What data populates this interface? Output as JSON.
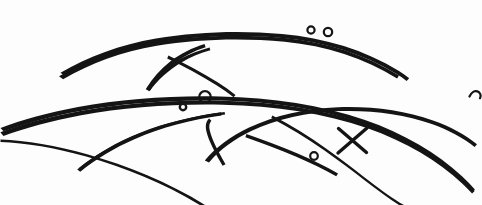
{
  "artwork": {
    "title": "Overlapping curved ink strokes",
    "medium": "black ink line drawing on white paper",
    "background_color": "#fdfdfd",
    "ink_color": "#141414",
    "width": 482,
    "height": 205,
    "alt_text": "A freehand ink drawing of several long overlapping arcs resembling blades of grass or feather strokes, with three small open circles, one larger open circle, and a crossed X mark."
  },
  "elements": {
    "arcs": [
      {
        "id": "upper-long-arc",
        "label": "upper long arc sweeping from left to upper right"
      },
      {
        "id": "upper-inner-arc",
        "label": "upper inner arc parallel beneath the long arc"
      },
      {
        "id": "upper-leaf-stroke",
        "label": "leaf-shaped stroke tapering to a point at lower left"
      },
      {
        "id": "upper-right-tail",
        "label": "thin tail descending to the right"
      },
      {
        "id": "mid-long-arc",
        "label": "middle long arc crossing the page"
      },
      {
        "id": "mid-inner-arc",
        "label": "middle inner arc parallel beneath"
      },
      {
        "id": "lower-left-blade",
        "label": "lower left blade tapering to a sharp point"
      },
      {
        "id": "lower-center-blade",
        "label": "lower center blade tapering to a point"
      },
      {
        "id": "lower-right-arc",
        "label": "lower right arc sweeping down to the right corner"
      },
      {
        "id": "right-hook-stroke",
        "label": "short hooked stroke at the right edge"
      }
    ],
    "circles": [
      {
        "id": "circle-upper-a",
        "label": "small open circle on upper arc, left of pair",
        "cx": 311,
        "cy": 30,
        "r": 4
      },
      {
        "id": "circle-upper-b",
        "label": "small open circle on upper arc, right of pair",
        "cx": 328,
        "cy": 32,
        "r": 4.5
      },
      {
        "id": "circle-mid-small",
        "label": "small open circle on middle arc",
        "cx": 183,
        "cy": 107,
        "r": 3.5
      },
      {
        "id": "circle-mid-large",
        "label": "larger open circle above middle arc",
        "cx": 205,
        "cy": 97,
        "r": 6
      },
      {
        "id": "circle-lower",
        "label": "small open circle on descending lower stroke",
        "cx": 314,
        "cy": 156,
        "r": 4
      },
      {
        "id": "circle-right-edge",
        "label": "small hooked circle at right edge",
        "cx": 474,
        "cy": 92,
        "r": 4.5
      }
    ],
    "marks": [
      {
        "id": "x-mark",
        "label": "crossed X mark over the lower arcs",
        "cx": 352,
        "cy": 140
      }
    ]
  }
}
